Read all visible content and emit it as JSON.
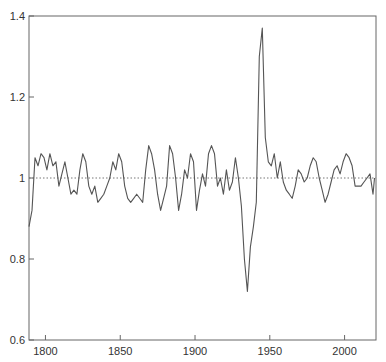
{
  "chart_data": {
    "type": "line",
    "title": "",
    "xlabel": "",
    "ylabel": "",
    "xlim": [
      1789,
      2021
    ],
    "ylim": [
      0.6,
      1.4
    ],
    "grid": false,
    "reference_line": {
      "y": 1.0,
      "style": "dotted"
    },
    "x_ticks": [
      1800,
      1850,
      1900,
      1950,
      2000
    ],
    "y_ticks": [
      0.6,
      0.8,
      1.0,
      1.2,
      1.4
    ],
    "x_tick_labels": [
      "1800",
      "1850",
      "1900",
      "1950",
      "2000"
    ],
    "y_tick_labels": [
      "0.6",
      "0.8",
      "1",
      "1.2",
      "1.4"
    ],
    "series": [
      {
        "name": "index",
        "color": "#555555",
        "x": [
          1789,
          1791,
          1793,
          1795,
          1797,
          1799,
          1801,
          1803,
          1805,
          1807,
          1809,
          1811,
          1813,
          1815,
          1817,
          1819,
          1821,
          1823,
          1825,
          1827,
          1829,
          1831,
          1833,
          1835,
          1837,
          1839,
          1841,
          1843,
          1845,
          1847,
          1849,
          1851,
          1853,
          1855,
          1857,
          1859,
          1861,
          1863,
          1865,
          1867,
          1869,
          1871,
          1873,
          1875,
          1877,
          1879,
          1881,
          1883,
          1885,
          1887,
          1889,
          1891,
          1893,
          1895,
          1897,
          1899,
          1901,
          1903,
          1905,
          1907,
          1909,
          1911,
          1913,
          1915,
          1917,
          1919,
          1921,
          1923,
          1925,
          1927,
          1929,
          1931,
          1933,
          1935,
          1937,
          1939,
          1941,
          1943,
          1945,
          1947,
          1949,
          1951,
          1953,
          1955,
          1957,
          1959,
          1961,
          1963,
          1965,
          1967,
          1969,
          1971,
          1973,
          1975,
          1977,
          1979,
          1981,
          1983,
          1985,
          1987,
          1989,
          1991,
          1993,
          1995,
          1997,
          1999,
          2001,
          2003,
          2005,
          2007,
          2009,
          2011,
          2013,
          2015,
          2017,
          2019,
          2020
        ],
        "values": [
          0.88,
          0.92,
          1.05,
          1.03,
          1.06,
          1.05,
          1.02,
          1.06,
          1.03,
          1.04,
          0.98,
          1.01,
          1.04,
          1.0,
          0.96,
          0.97,
          0.96,
          1.02,
          1.06,
          1.04,
          0.98,
          0.96,
          0.98,
          0.94,
          0.95,
          0.96,
          0.98,
          1.0,
          1.04,
          1.02,
          1.06,
          1.04,
          0.98,
          0.95,
          0.94,
          0.95,
          0.96,
          0.95,
          0.94,
          1.02,
          1.08,
          1.06,
          1.02,
          0.96,
          0.92,
          0.95,
          0.98,
          1.08,
          1.06,
          1.0,
          0.92,
          0.96,
          1.02,
          1.0,
          1.06,
          1.04,
          0.92,
          0.97,
          1.01,
          0.98,
          1.06,
          1.08,
          1.06,
          0.98,
          1.0,
          0.96,
          1.02,
          0.97,
          0.99,
          1.05,
          1.0,
          0.93,
          0.8,
          0.72,
          0.83,
          0.88,
          0.94,
          1.3,
          1.37,
          1.1,
          1.04,
          1.03,
          1.06,
          1.0,
          1.04,
          0.99,
          0.97,
          0.96,
          0.95,
          0.98,
          1.02,
          1.01,
          0.99,
          1.0,
          1.03,
          1.05,
          1.04,
          1.0,
          0.97,
          0.94,
          0.96,
          0.99,
          1.02,
          1.03,
          1.01,
          1.04,
          1.06,
          1.05,
          1.03,
          0.98,
          0.98,
          0.98,
          0.99,
          1.0,
          1.01,
          0.96,
          1.0
        ]
      }
    ]
  }
}
